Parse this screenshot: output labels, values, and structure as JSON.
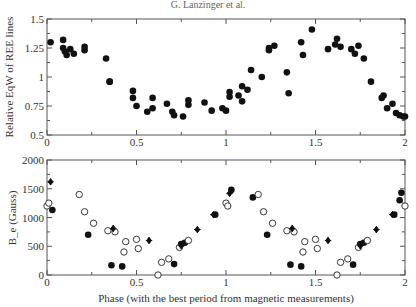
{
  "title": "G. Lanzinger et al.",
  "chart_data": [
    {
      "type": "scatter",
      "panel": "top",
      "title": "",
      "xlabel": "",
      "ylabel": "Relative EqW of REE lines",
      "xlim": [
        0,
        2
      ],
      "ylim": [
        0.5,
        1.5
      ],
      "xticks": [
        0,
        0.5,
        1,
        1.5,
        2
      ],
      "xtick_labels": [
        "0",
        "0.5",
        "1",
        "1.5",
        "2"
      ],
      "yticks": [
        0.5,
        0.75,
        1,
        1.25,
        1.5
      ],
      "ytick_labels": [
        "0.5",
        "0.75",
        "1",
        "1.25",
        "1.5"
      ],
      "grid": false,
      "series": [
        {
          "name": "REE EqW",
          "marker": "filled-circle",
          "x": [
            0.02,
            0.09,
            0.09,
            0.1,
            0.11,
            0.13,
            0.15,
            0.21,
            0.21,
            0.33,
            0.35,
            0.35,
            0.48,
            0.48,
            0.5,
            0.56,
            0.59,
            0.59,
            0.67,
            0.7,
            0.71,
            0.76,
            0.79,
            0.79,
            0.88,
            0.92,
            0.98,
            1.0,
            1.02,
            1.02,
            1.07,
            1.09,
            1.09,
            1.12,
            1.14,
            1.2,
            1.24,
            1.24,
            1.27,
            1.34,
            1.35,
            1.42,
            1.43,
            1.48,
            1.57,
            1.61,
            1.62,
            1.64,
            1.7,
            1.72,
            1.74,
            1.77,
            1.81,
            1.87,
            1.88,
            1.9,
            1.93,
            1.95,
            1.97,
            1.99,
            2.0,
            2.0
          ],
          "y": [
            1.3,
            1.32,
            1.25,
            1.22,
            1.19,
            1.24,
            1.2,
            1.26,
            1.23,
            1.16,
            0.96,
            0.96,
            0.82,
            0.88,
            0.75,
            0.7,
            0.82,
            0.73,
            0.77,
            0.7,
            0.67,
            0.66,
            0.8,
            0.76,
            0.78,
            0.71,
            0.73,
            0.71,
            0.83,
            0.87,
            0.84,
            0.92,
            0.79,
            0.89,
            1.06,
            1.0,
            1.23,
            1.25,
            1.27,
            1.04,
            0.86,
            1.3,
            1.19,
            1.41,
            1.24,
            1.28,
            1.33,
            1.26,
            1.24,
            1.2,
            1.27,
            1.16,
            0.96,
            0.82,
            0.84,
            0.73,
            0.77,
            0.69,
            0.67,
            0.66,
            0.66
          ],
          "note": "Phase 0-1 data repeated at phase+1 to show two cycles"
        }
      ]
    },
    {
      "type": "scatter",
      "panel": "bottom",
      "title": "",
      "xlabel": "Phase (with the best period from magnetic measurements)",
      "ylabel": "B_e (Gauss)",
      "xlim": [
        0,
        2
      ],
      "ylim": [
        0,
        2000
      ],
      "xticks": [
        0,
        0.5,
        1,
        1.5,
        2
      ],
      "xtick_labels": [
        "0",
        "0.5",
        "1",
        "1.5",
        "2"
      ],
      "yticks": [
        0,
        500,
        1000,
        1500,
        2000
      ],
      "ytick_labels": [
        "0",
        "500",
        "1000",
        "1500",
        "2000"
      ],
      "grid": false,
      "series": [
        {
          "name": "Filled circles",
          "marker": "filled-circle",
          "x": [
            0.03,
            0.23,
            0.36,
            0.42,
            0.71,
            0.75,
            0.77,
            0.94,
            1.03,
            1.15,
            1.23,
            1.36,
            1.42,
            1.71,
            1.75,
            1.77,
            1.94,
            1.97,
            1.98
          ],
          "y": [
            1130,
            700,
            170,
            150,
            190,
            540,
            560,
            1050,
            1480,
            1350,
            700,
            180,
            150,
            180,
            540,
            560,
            1050,
            1300,
            1430
          ]
        },
        {
          "name": "Open circles",
          "marker": "open-circle",
          "x": [
            0.0,
            0.01,
            0.18,
            0.21,
            0.26,
            0.34,
            0.38,
            0.43,
            0.44,
            0.5,
            0.51,
            0.62,
            0.64,
            0.68,
            0.74,
            0.79,
            1.0,
            1.01,
            1.18,
            1.21,
            1.26,
            1.34,
            1.38,
            1.43,
            1.44,
            1.5,
            1.51,
            1.62,
            1.64,
            1.68,
            1.74,
            1.79,
            2.0
          ],
          "y": [
            1200,
            1250,
            1400,
            1100,
            900,
            770,
            750,
            400,
            580,
            620,
            460,
            0,
            220,
            280,
            480,
            600,
            1250,
            1200,
            1400,
            1100,
            900,
            770,
            750,
            400,
            580,
            620,
            460,
            0,
            220,
            280,
            480,
            600,
            1200
          ]
        },
        {
          "name": "Filled diamonds",
          "marker": "filled-diamond",
          "x": [
            0.02,
            0.37,
            0.57,
            0.75,
            0.84,
            0.93,
            1.02,
            1.37,
            1.57,
            1.75,
            1.84,
            1.93
          ],
          "y": [
            1620,
            810,
            600,
            510,
            790,
            1050,
            1420,
            810,
            600,
            510,
            790,
            1050
          ]
        }
      ]
    }
  ]
}
